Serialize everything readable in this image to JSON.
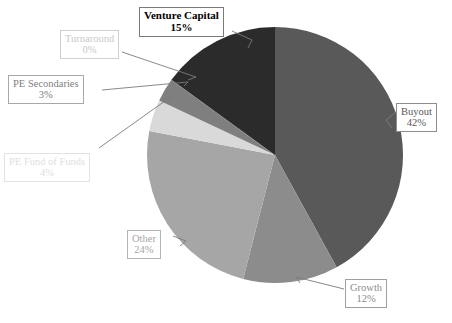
{
  "chart_data": {
    "type": "pie",
    "title": "",
    "subtitle": "",
    "xlabel": "",
    "ylabel": "",
    "legend_position": "none",
    "grid": false,
    "units": "percent",
    "start_angle_deg": 0,
    "direction": "clockwise",
    "center": {
      "cx": 275,
      "cy": 155,
      "r": 128
    },
    "categories": [
      "Buyout",
      "Growth",
      "Other",
      "PE Fund of Funds",
      "PE Secondaries",
      "Turnaround",
      "Venture Capital"
    ],
    "values": [
      42,
      12,
      24,
      4,
      3,
      0,
      15
    ],
    "slices": [
      {
        "name": "Buyout",
        "label": "Buyout",
        "percent": 42,
        "percent_text": "42%",
        "color": "#595959",
        "order": 1
      },
      {
        "name": "Growth",
        "label": "Growth",
        "percent": 12,
        "percent_text": "12%",
        "color": "#8c8c8c",
        "order": 2
      },
      {
        "name": "Other",
        "label": "Other",
        "percent": 24,
        "percent_text": "24%",
        "color": "#a6a6a6",
        "order": 3
      },
      {
        "name": "PE Fund of Funds",
        "label": "PE Fund of Funds",
        "percent": 4,
        "percent_text": "4%",
        "color": "#d9d9d9",
        "order": 4
      },
      {
        "name": "PE Secondaries",
        "label": "PE Secondaries",
        "percent": 3,
        "percent_text": "3%",
        "color": "#7f7f7f",
        "order": 5
      },
      {
        "name": "Turnaround",
        "label": "Turnaround",
        "percent": 0,
        "percent_text": "0%",
        "color": "#bfbfbf",
        "order": 6
      },
      {
        "name": "Venture Capital",
        "label": "Venture Capital",
        "percent": 15,
        "percent_text": "15%",
        "color": "#2b2b2b",
        "order": 7
      }
    ]
  },
  "labels": {
    "buyout": {
      "category": "Buyout",
      "percent": "42%"
    },
    "growth": {
      "category": "Growth",
      "percent": "12%"
    },
    "other": {
      "category": "Other",
      "percent": "24%"
    },
    "pe_fund_of_funds": {
      "category": "PE Fund of Funds",
      "percent": "4%"
    },
    "pe_secondaries": {
      "category": "PE Secondaries",
      "percent": "3%"
    },
    "turnaround": {
      "category": "Turnaround",
      "percent": "0%"
    },
    "venture_capital": {
      "category": "Venture Capital",
      "percent": "15%"
    }
  },
  "colors": {
    "background": "#ffffff",
    "leader_line": "#7a7a7a",
    "callout_border": "#9a9a9a",
    "buyout": "#595959",
    "growth": "#8c8c8c",
    "other": "#a6a6a6",
    "pe_fund_of_funds": "#d9d9d9",
    "pe_secondaries": "#7f7f7f",
    "turnaround": "#bfbfbf",
    "venture_capital": "#2b2b2b"
  }
}
